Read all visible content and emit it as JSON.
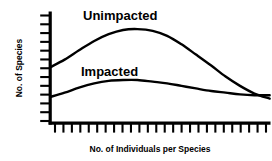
{
  "chart_data": {
    "type": "line",
    "title": "",
    "subtitle": "",
    "xlabel": "No. of Individuals per Species",
    "ylabel": "No. of Species",
    "grid": false,
    "legend_position": "inline-annotations",
    "axis_tick_labels": {
      "x": [],
      "y": []
    },
    "x_tick_count": 26,
    "y_tick_count": 13,
    "xlim": [
      0,
      26
    ],
    "ylim": [
      0,
      13
    ],
    "annotations": [
      {
        "text": "Unimpacted",
        "series": "Unimpacted",
        "x": 7.6,
        "y": 12.2
      },
      {
        "text": "Impacted",
        "series": "Impacted",
        "x": 7.0,
        "y": 7.1
      }
    ],
    "series": [
      {
        "name": "Unimpacted",
        "color": "#000000",
        "x": [
          0.0,
          1.7,
          3.4,
          5.2,
          6.9,
          8.6,
          10.3,
          12.1,
          13.8,
          15.5,
          17.2,
          19.0,
          20.7,
          22.4,
          24.1,
          25.9
        ],
        "values": [
          6.6,
          7.5,
          8.6,
          9.7,
          10.5,
          11.0,
          11.1,
          10.9,
          10.3,
          9.3,
          8.1,
          6.8,
          5.5,
          4.4,
          3.5,
          2.9
        ]
      },
      {
        "name": "Impacted",
        "color": "#000000",
        "x": [
          0.0,
          1.7,
          3.4,
          5.2,
          6.9,
          8.6,
          10.3,
          12.1,
          13.8,
          15.5,
          17.2,
          19.0,
          20.7,
          22.4,
          24.1,
          25.9
        ],
        "values": [
          3.1,
          3.6,
          4.2,
          4.7,
          5.0,
          5.1,
          5.1,
          4.9,
          4.7,
          4.4,
          4.1,
          3.8,
          3.6,
          3.4,
          3.3,
          3.3
        ]
      }
    ],
    "crossing_point": {
      "x": 21.6,
      "y": 3.5
    },
    "colors": {
      "line": "#000000",
      "axis": "#000000",
      "background": "#ffffff",
      "text": "#000000"
    }
  }
}
